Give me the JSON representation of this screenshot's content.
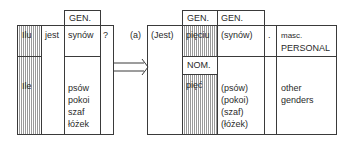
{
  "left_table": {
    "header_gen": "GEN.",
    "row1": {
      "col1": "Ilu",
      "col2": "jest",
      "col3": "synów",
      "col4": "?"
    },
    "row2": {
      "col1": "Ile",
      "col3": [
        "psów",
        "pokoi",
        "szaf",
        "łóżek"
      ]
    }
  },
  "arrow": {
    "label": "transformation-arrow"
  },
  "right_table": {
    "label": "(a)",
    "verb": "(Jest)",
    "header_gen_1": "GEN.",
    "header_gen_2": "GEN.",
    "header_nom": "NOM.",
    "row1": {
      "numeral": "pięciu",
      "noun": "(synów)",
      "punct": ".",
      "gender": [
        "masc.",
        "PERSONAL"
      ]
    },
    "row2": {
      "numeral": "pięć",
      "nouns": [
        "(psów)",
        "(pokoi)",
        "(szaf)",
        "(łóżek)"
      ],
      "gender": [
        "other",
        "genders"
      ]
    }
  }
}
